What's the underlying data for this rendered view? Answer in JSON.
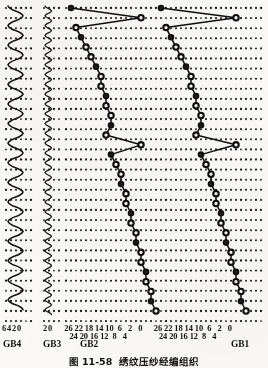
{
  "figure": {
    "caption_number": "图 11-58",
    "caption_text": "绣纹压纱经编组织"
  },
  "bars": [
    {
      "id": "GB4",
      "label": "GB4",
      "type": "zigzag-wide",
      "needle_scale": [
        6,
        4,
        2,
        0
      ],
      "description": "宽幅曲折垫纱(绣纹梳栉)"
    },
    {
      "id": "GB3",
      "label": "GB3",
      "type": "zigzag-narrow",
      "needle_scale": [
        2,
        0
      ],
      "description": "窄幅曲折垫纱(编链梳栉)"
    },
    {
      "id": "GB2",
      "label": "GB2",
      "type": "chain-diagonal",
      "needle_scale_top": [
        26,
        22,
        18,
        14,
        10,
        6,
        2,
        0
      ],
      "needle_scale_bottom": [
        24,
        20,
        16,
        12,
        8,
        4
      ],
      "description": "斜向移动压纱垫纱"
    },
    {
      "id": "GB1",
      "label": "GB1",
      "type": "chain-diagonal",
      "needle_scale_top": [
        26,
        22,
        18,
        14,
        10,
        6,
        2,
        0
      ],
      "needle_scale_bottom": [
        24,
        20,
        16,
        12,
        8,
        4
      ],
      "description": "斜向移动压纱垫纱"
    }
  ],
  "chart_data": {
    "type": "scatter",
    "xlabel": "针位 (needle position)",
    "ylabel": "横列 (course)",
    "grid": true,
    "legend": "none",
    "axis_ticks": {
      "GB4": [
        "6",
        "4",
        "2",
        "0"
      ],
      "GB3": [
        "2",
        "0"
      ],
      "GB2_upper": [
        "26",
        "22",
        "18",
        "14",
        "10",
        "6",
        "2",
        "0"
      ],
      "GB2_lower": [
        "24",
        "20",
        "16",
        "12",
        "8",
        "4"
      ],
      "GB1_upper": [
        "26",
        "22",
        "18",
        "14",
        "10",
        "6",
        "2",
        "0"
      ],
      "GB1_lower": [
        "24",
        "20",
        "16",
        "12",
        "8",
        "4"
      ]
    },
    "series": [
      {
        "name": "GB4",
        "kind": "lapping-zigzag",
        "amplitude_needles": 3,
        "courses": 28,
        "values": [
          0,
          3,
          0,
          3,
          0,
          3,
          0,
          3,
          0,
          3,
          0,
          3,
          0,
          3,
          0,
          3,
          0,
          3,
          0,
          3,
          0,
          3,
          0,
          3,
          0,
          3,
          0,
          3
        ]
      },
      {
        "name": "GB3",
        "kind": "lapping-zigzag",
        "amplitude_needles": 1,
        "courses": 30,
        "values": [
          0,
          1,
          0,
          1,
          0,
          1,
          0,
          1,
          0,
          1,
          0,
          1,
          0,
          1,
          0,
          1,
          0,
          1,
          0,
          1,
          0,
          1,
          0,
          1,
          0,
          1,
          0,
          1,
          0,
          1
        ]
      },
      {
        "name": "GB2",
        "kind": "lapping-chain-diagonal",
        "courses": 31,
        "values": [
          3,
          4,
          4,
          5,
          5,
          6,
          6,
          7,
          7,
          8,
          8,
          9,
          9,
          10,
          10,
          11,
          12,
          6,
          13,
          12,
          12,
          13,
          13,
          14,
          14,
          15,
          16,
          17,
          18,
          19,
          6,
          20
        ]
      },
      {
        "name": "GB1",
        "kind": "lapping-chain-diagonal",
        "courses": 31,
        "values": [
          3,
          4,
          4,
          5,
          5,
          6,
          6,
          7,
          7,
          8,
          8,
          9,
          9,
          10,
          10,
          11,
          12,
          5,
          13,
          12,
          12,
          13,
          13,
          14,
          14,
          15,
          16,
          17,
          18,
          19,
          5,
          20
        ]
      }
    ]
  }
}
